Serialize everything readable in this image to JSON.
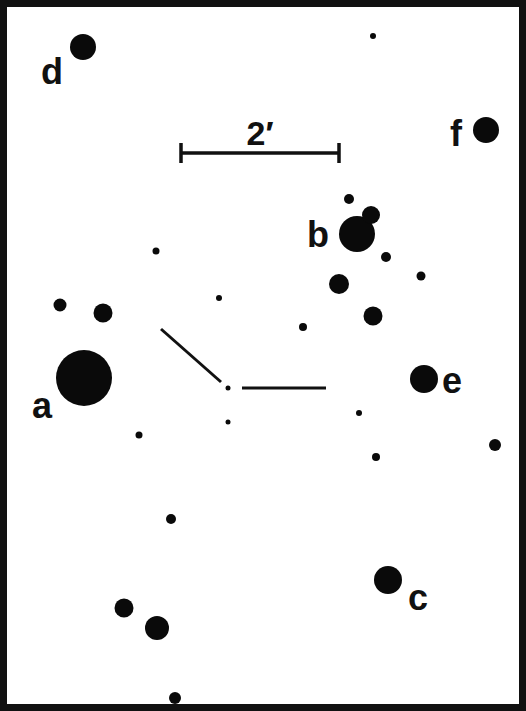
{
  "scale_bar": {
    "label": "2′",
    "x1": 181,
    "x2": 339,
    "y": 153
  },
  "labels": [
    {
      "id": "a",
      "text": "a",
      "x": 42,
      "y": 418
    },
    {
      "id": "b",
      "text": "b",
      "x": 318,
      "y": 247
    },
    {
      "id": "c",
      "text": "c",
      "x": 418,
      "y": 610
    },
    {
      "id": "d",
      "text": "d",
      "x": 52,
      "y": 84
    },
    {
      "id": "e",
      "text": "e",
      "x": 452,
      "y": 393
    },
    {
      "id": "f",
      "text": "f",
      "x": 456,
      "y": 146
    }
  ],
  "stars": [
    {
      "x": 83,
      "y": 47,
      "r": 13,
      "label": "d"
    },
    {
      "x": 373,
      "y": 36,
      "r": 3
    },
    {
      "x": 486,
      "y": 130,
      "r": 13,
      "label": "f"
    },
    {
      "x": 349,
      "y": 199,
      "r": 5
    },
    {
      "x": 357,
      "y": 234,
      "r": 18,
      "label": "b"
    },
    {
      "x": 371,
      "y": 215,
      "r": 9
    },
    {
      "x": 386,
      "y": 257,
      "r": 5
    },
    {
      "x": 421,
      "y": 276,
      "r": 4.5
    },
    {
      "x": 156,
      "y": 251,
      "r": 3.5
    },
    {
      "x": 219,
      "y": 298,
      "r": 3
    },
    {
      "x": 339,
      "y": 284,
      "r": 10
    },
    {
      "x": 373,
      "y": 316,
      "r": 9.5
    },
    {
      "x": 303,
      "y": 327,
      "r": 4
    },
    {
      "x": 60,
      "y": 305,
      "r": 6.5
    },
    {
      "x": 103,
      "y": 313,
      "r": 9.5
    },
    {
      "x": 84,
      "y": 378,
      "r": 28,
      "label": "a"
    },
    {
      "x": 228,
      "y": 388,
      "r": 2.5
    },
    {
      "x": 228,
      "y": 422,
      "r": 2.5
    },
    {
      "x": 139,
      "y": 435,
      "r": 3.5
    },
    {
      "x": 424,
      "y": 379,
      "r": 14,
      "label": "e"
    },
    {
      "x": 359,
      "y": 413,
      "r": 3
    },
    {
      "x": 376,
      "y": 457,
      "r": 4
    },
    {
      "x": 495,
      "y": 445,
      "r": 6
    },
    {
      "x": 171,
      "y": 519,
      "r": 5
    },
    {
      "x": 388,
      "y": 580,
      "r": 14,
      "label": "c"
    },
    {
      "x": 124,
      "y": 608,
      "r": 9.5
    },
    {
      "x": 157,
      "y": 628,
      "r": 12
    },
    {
      "x": 175,
      "y": 698,
      "r": 6
    }
  ],
  "target_marker": {
    "center": {
      "x": 228,
      "y": 388
    },
    "lines": [
      {
        "x1": 161,
        "y1": 329,
        "x2": 221,
        "y2": 382
      },
      {
        "x1": 242,
        "y1": 388,
        "x2": 326,
        "y2": 388
      }
    ]
  },
  "colors": {
    "ink": "#0a0a0a",
    "background": "#ffffff"
  }
}
